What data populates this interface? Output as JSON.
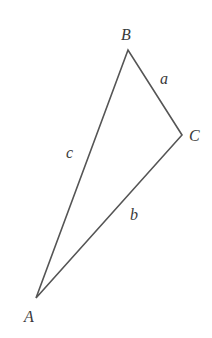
{
  "diagram": {
    "type": "triangle",
    "stroke_color": "#555555",
    "label_color": "#3a3a3a",
    "vertices": [
      {
        "name": "A",
        "x": 36,
        "y": 298,
        "label": "A",
        "label_x": 24,
        "label_y": 322
      },
      {
        "name": "B",
        "x": 128,
        "y": 50,
        "label": "B",
        "label_x": 121,
        "label_y": 40
      },
      {
        "name": "C",
        "x": 182,
        "y": 135,
        "label": "C",
        "label_x": 189,
        "label_y": 141
      }
    ],
    "sides": [
      {
        "name": "a",
        "from": "B",
        "to": "C",
        "label": "a",
        "label_x": 160,
        "label_y": 84
      },
      {
        "name": "b",
        "from": "C",
        "to": "A",
        "label": "b",
        "label_x": 130,
        "label_y": 220
      },
      {
        "name": "c",
        "from": "A",
        "to": "B",
        "label": "c",
        "label_x": 66,
        "label_y": 158
      }
    ]
  }
}
